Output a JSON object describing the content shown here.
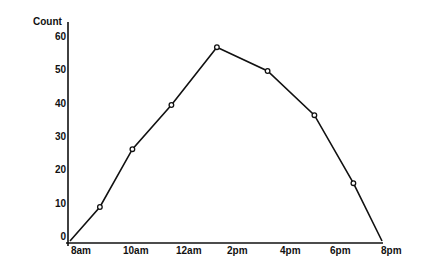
{
  "chart_data": {
    "type": "line",
    "title": "",
    "xlabel": "",
    "ylabel": "Count",
    "ylim": [
      0,
      60
    ],
    "xlim_hours_from_8am": [
      0,
      12
    ],
    "x_tick_labels": [
      "8am",
      "10am",
      "12am",
      "2pm",
      "4pm",
      "6pm",
      "8pm"
    ],
    "y_tick_labels": [
      "0",
      "10",
      "20",
      "30",
      "40",
      "50",
      "60"
    ],
    "grid": false,
    "legend": null,
    "series": [
      {
        "name": "Count",
        "markers": "open-circle",
        "x_hours_from_8am": [
          0,
          1.15,
          2.4,
          3.9,
          5.65,
          7.6,
          9.4,
          10.9,
          12
        ],
        "values": [
          0,
          10,
          27,
          40,
          57,
          50,
          37,
          17,
          0
        ],
        "marked": [
          false,
          true,
          true,
          true,
          true,
          true,
          true,
          true,
          false
        ]
      }
    ]
  },
  "axes": {
    "y_title": "Count",
    "y_ticks": [
      {
        "label": "60",
        "top": 31
      },
      {
        "label": "50",
        "top": 64
      },
      {
        "label": "40",
        "top": 98
      },
      {
        "label": "30",
        "top": 131
      },
      {
        "label": "20",
        "top": 164
      },
      {
        "label": "10",
        "top": 198
      },
      {
        "label": "0",
        "top": 231
      }
    ],
    "x_ticks": [
      {
        "label": "8am",
        "left": 71
      },
      {
        "label": "10am",
        "left": 123
      },
      {
        "label": "12am",
        "left": 176
      },
      {
        "label": "2pm",
        "left": 227
      },
      {
        "label": "4pm",
        "left": 280
      },
      {
        "label": "6pm",
        "left": 330
      },
      {
        "label": "8pm",
        "left": 381
      }
    ]
  },
  "colors": {
    "line": "#111111",
    "axis": "#111111",
    "background": "#ffffff"
  }
}
